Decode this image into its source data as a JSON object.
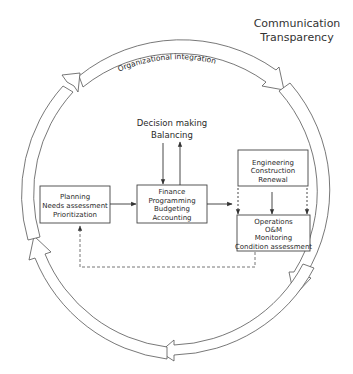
{
  "diagram": {
    "title": {
      "line1": "Communication",
      "line2": "Transparency"
    },
    "ring_label": "Organizational integration",
    "decision": {
      "line1": "Decision making",
      "line2": "Balancing"
    },
    "boxes": {
      "planning": {
        "lines": [
          "Planning",
          "Needs assessment",
          "Prioritization"
        ]
      },
      "finance": {
        "lines": [
          "Finance",
          "Programming",
          "Budgeting",
          "Accounting"
        ]
      },
      "engineering": {
        "lines": [
          "Engineering",
          "Construction",
          "Renewal"
        ]
      },
      "operations": {
        "lines": [
          "Operations",
          "O&M",
          "Monitoring",
          "Condition assessment"
        ]
      }
    },
    "flows": [
      {
        "from": "planning",
        "to": "finance",
        "style": "solid"
      },
      {
        "from": "finance",
        "to": "engineering/operations",
        "style": "solid"
      },
      {
        "from": "decision",
        "to": "finance",
        "style": "solid"
      },
      {
        "from": "finance",
        "to": "decision",
        "style": "solid"
      },
      {
        "from": "engineering",
        "to": "operations",
        "style": "solid"
      },
      {
        "from": "engineering",
        "to": "operations",
        "style": "dashed"
      },
      {
        "from": "operations",
        "to": "planning",
        "style": "dashed"
      }
    ],
    "colors": {
      "stroke": "#444444",
      "text": "#2a2a2a",
      "background": "#ffffff"
    }
  }
}
